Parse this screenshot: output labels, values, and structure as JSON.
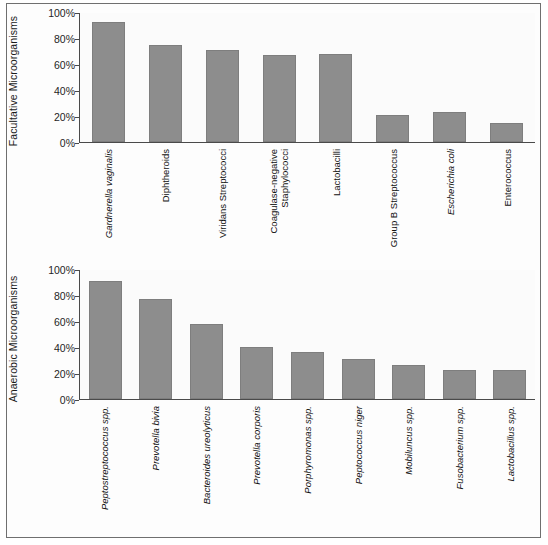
{
  "chart_data": [
    {
      "type": "bar",
      "title": "",
      "ylabel": "Facultative Microorganisms",
      "xlabel": "",
      "ylim": [
        0,
        100
      ],
      "yticks": [
        "0%",
        "20%",
        "40%",
        "60%",
        "80%",
        "100%"
      ],
      "ytick_values": [
        0,
        20,
        40,
        60,
        80,
        100
      ],
      "grid": false,
      "legend": "none",
      "bar_color": "#8d8d8d",
      "categories": [
        "Gardnerella vaginalis",
        "Diphtheroids",
        "Viridans Streptococci",
        "Coagulase-negative Staphylococci",
        "Lactobacilli",
        "Group B Streptococcus",
        "Escherichia coli",
        "Enterococcus"
      ],
      "category_styles": [
        "italic",
        "normal",
        "normal",
        "normal",
        "normal",
        "normal",
        "italic",
        "normal"
      ],
      "category_lines": [
        [
          "Gardnerella vaginalis"
        ],
        [
          "Diphtheroids"
        ],
        [
          "Viridans Streptococci"
        ],
        [
          "Coagulase-negative",
          "Staphylococci"
        ],
        [
          "Lactobacilli"
        ],
        [
          "Group B Streptococcus"
        ],
        [
          "Escherichia coli"
        ],
        [
          "Enterococcus"
        ]
      ],
      "values": [
        92,
        75,
        71,
        67,
        68,
        21,
        23,
        15
      ]
    },
    {
      "type": "bar",
      "title": "",
      "ylabel": "Anaerobic Microorganisms",
      "xlabel": "",
      "ylim": [
        0,
        100
      ],
      "yticks": [
        "0%",
        "20%",
        "40%",
        "60%",
        "80%",
        "100%"
      ],
      "ytick_values": [
        0,
        20,
        40,
        60,
        80,
        100
      ],
      "grid": false,
      "legend": "none",
      "bar_color": "#8d8d8d",
      "categories": [
        "Peptostreptococcus spp.",
        "Prevotella bivia",
        "Bacteroides ureolyticus",
        "Prevotella corporis",
        "Porphyromonas spp.",
        "Peptococcus niger",
        "Mobiluncus spp.",
        "Fusobacterium spp.",
        "Lactobacillus spp."
      ],
      "category_styles": [
        "italic",
        "italic",
        "italic",
        "italic",
        "italic",
        "italic",
        "italic",
        "italic",
        "italic"
      ],
      "category_lines": [
        [
          "Peptostreptococcus spp."
        ],
        [
          "Prevotella bivia"
        ],
        [
          "Bacteroides ureolyticus"
        ],
        [
          "Prevotella corporis"
        ],
        [
          "Porphyromonas spp."
        ],
        [
          "Peptococcus niger"
        ],
        [
          "Mobiluncus spp."
        ],
        [
          "Fusobacterium spp."
        ],
        [
          "Lactobacillus spp."
        ]
      ],
      "values": [
        91,
        77,
        58,
        40,
        36,
        31,
        26,
        22,
        22
      ]
    }
  ]
}
